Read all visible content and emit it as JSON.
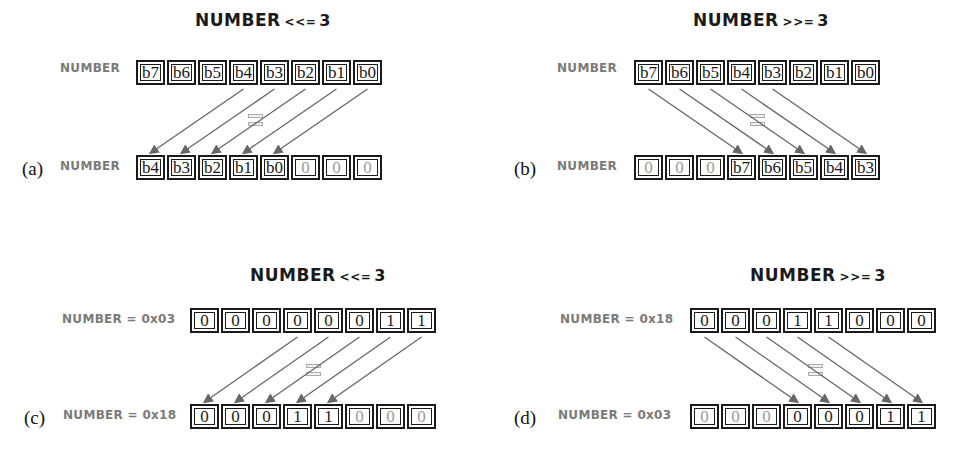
{
  "figure": {
    "colors": {
      "box_border": "#1a1a1a",
      "arrow": "#666666",
      "label_gray": "#7a7a7a",
      "filled_bit": "#9a9a9a"
    },
    "panels": [
      {
        "id": "a",
        "panel_label": "(a)",
        "title_var": "NUMBER",
        "title_op": "<<=",
        "title_num": "3",
        "direction": "left",
        "shift": 3,
        "top_label": "NUMBER",
        "bottom_label": "NUMBER",
        "top_bits": [
          "b7",
          "b6",
          "b5",
          "b4",
          "b3",
          "b2",
          "b1",
          "b0"
        ],
        "bottom_bits": [
          "b4",
          "b3",
          "b2",
          "b1",
          "b0",
          "0",
          "0",
          "0"
        ],
        "filled_positions": [
          5,
          6,
          7
        ]
      },
      {
        "id": "b",
        "panel_label": "(b)",
        "title_var": "NUMBER",
        "title_op": ">>=",
        "title_num": "3",
        "direction": "right",
        "shift": 3,
        "top_label": "NUMBER",
        "bottom_label": "NUMBER",
        "top_bits": [
          "b7",
          "b6",
          "b5",
          "b4",
          "b3",
          "b2",
          "b1",
          "b0"
        ],
        "bottom_bits": [
          "0",
          "0",
          "0",
          "b7",
          "b6",
          "b5",
          "b4",
          "b3"
        ],
        "filled_positions": [
          0,
          1,
          2
        ]
      },
      {
        "id": "c",
        "panel_label": "(c)",
        "title_var": "NUMBER",
        "title_op": "<<=",
        "title_num": "3",
        "direction": "left",
        "shift": 3,
        "top_label": "NUMBER = 0x03",
        "bottom_label": "NUMBER = 0x18",
        "top_bits": [
          "0",
          "0",
          "0",
          "0",
          "0",
          "0",
          "1",
          "1"
        ],
        "bottom_bits": [
          "0",
          "0",
          "0",
          "1",
          "1",
          "0",
          "0",
          "0"
        ],
        "filled_positions": [
          5,
          6,
          7
        ]
      },
      {
        "id": "d",
        "panel_label": "(d)",
        "title_var": "NUMBER",
        "title_op": ">>=",
        "title_num": "3",
        "direction": "right",
        "shift": 3,
        "top_label": "NUMBER = 0x18",
        "bottom_label": "NUMBER = 0x03",
        "top_bits": [
          "0",
          "0",
          "0",
          "1",
          "1",
          "0",
          "0",
          "0"
        ],
        "bottom_bits": [
          "0",
          "0",
          "0",
          "0",
          "0",
          "0",
          "1",
          "1"
        ],
        "filled_positions": [
          0,
          1,
          2
        ]
      }
    ]
  }
}
